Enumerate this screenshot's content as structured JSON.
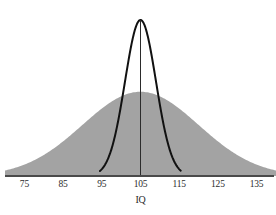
{
  "figure": {
    "background_color": "#ffffff",
    "width": 276,
    "height": 215
  },
  "axis": {
    "title": "IQ",
    "line_color": "#4a4a4a",
    "tick_labels": [
      "75",
      "85",
      "95",
      "105",
      "115",
      "125",
      "135"
    ],
    "tick_values": [
      75,
      85,
      95,
      105,
      115,
      125,
      135
    ]
  },
  "chart_data": {
    "type": "line",
    "title": "",
    "subtitle": "",
    "xlabel": "IQ",
    "ylabel": "",
    "xlim": [
      70,
      140
    ],
    "ylim": [
      0,
      1
    ],
    "grid": false,
    "legend": "none",
    "annotations": [
      "Two overlaid normal distributions of IQ sharing the same mean of 105",
      "Wide gray-filled curve: broad population spread",
      "Narrow black-outlined curve: tightly clustered subgroup",
      "Thin vertical line marks the common mean at IQ 105"
    ],
    "series": [
      {
        "name": "Wide distribution (shaded)",
        "style": "filled-area",
        "fill_color": "#a3a3a3",
        "line_color": "#a3a3a3",
        "mean": 105,
        "sd": 15,
        "peak_height": 0.54,
        "x": [
          70,
          75,
          80,
          85,
          90,
          95,
          100,
          105,
          110,
          115,
          120,
          125,
          130,
          135,
          140
        ],
        "y": [
          0.01,
          0.02,
          0.05,
          0.1,
          0.2,
          0.33,
          0.47,
          0.54,
          0.47,
          0.33,
          0.2,
          0.1,
          0.05,
          0.02,
          0.01
        ]
      },
      {
        "name": "Narrow distribution (outline)",
        "style": "outline",
        "fill_color": "none",
        "line_color": "#111111",
        "line_width": 2,
        "mean": 105,
        "sd": 4,
        "peak_height": 1.0,
        "x": [
          95,
          97,
          99,
          101,
          103,
          105,
          107,
          109,
          111,
          113,
          115
        ],
        "y": [
          0.0,
          0.08,
          0.25,
          0.54,
          0.88,
          1.0,
          0.88,
          0.54,
          0.25,
          0.08,
          0.0
        ]
      }
    ],
    "center_line": {
      "name": "Mean marker",
      "x": 105,
      "color": "#2b2b2b",
      "width": 1
    }
  }
}
